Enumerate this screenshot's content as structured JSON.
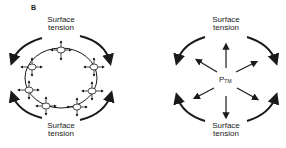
{
  "figure": {
    "panel_label": "B",
    "left_diagram": {
      "top_label_line1": "Surface",
      "top_label_line2": "tension",
      "bottom_label_line1": "Surface",
      "bottom_label_line2": "tension",
      "description": "Circle with small bubbles around circumference, each with outward/inward arrows; curved arrows around indicating surface tension"
    },
    "right_diagram": {
      "top_label_line1": "Surface",
      "top_label_line2": "tension",
      "bottom_label_line1": "Surface",
      "bottom_label_line2": "tension",
      "center_label_main": "P",
      "center_label_sub": "TM",
      "description": "Radial arrows outward from P_TM center, curved arrows around indicating surface tension"
    }
  }
}
